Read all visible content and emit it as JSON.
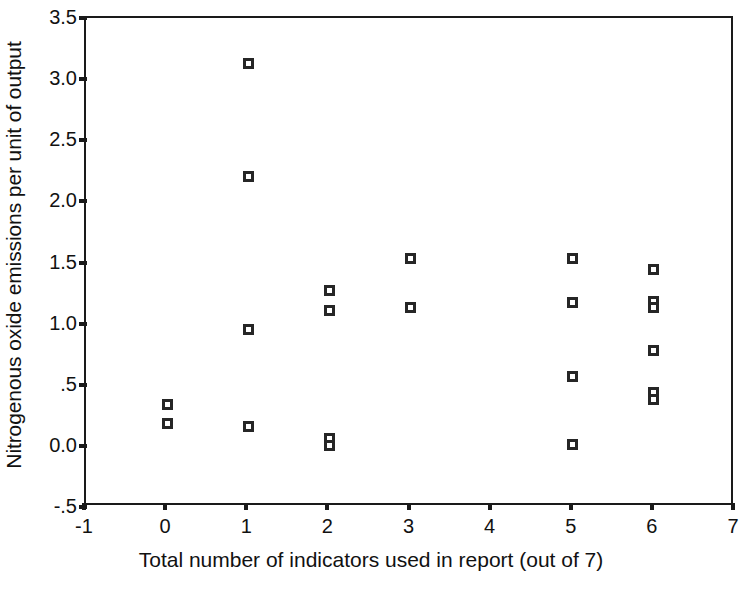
{
  "chart_data": {
    "type": "scatter",
    "title": "",
    "xlabel": "Total number of indicators used in report (out of 7)",
    "ylabel": "Nitrogenous oxide emissions per unit of output",
    "xlim": [
      -1,
      7
    ],
    "ylim": [
      -0.5,
      3.5
    ],
    "xticks": [
      -1,
      0,
      1,
      2,
      3,
      4,
      5,
      6,
      7
    ],
    "xtick_labels": [
      "-1",
      "0",
      "1",
      "2",
      "3",
      "4",
      "5",
      "6",
      "7"
    ],
    "yticks": [
      -0.5,
      0.0,
      0.5,
      1.0,
      1.5,
      2.0,
      2.5,
      3.0,
      3.5
    ],
    "ytick_labels": [
      "-.5",
      "0.0",
      ".5",
      "1.0",
      "1.5",
      "2.0",
      "2.5",
      "3.0",
      "3.5"
    ],
    "grid": false,
    "legend": false,
    "marker": "open-square",
    "marker_color": "#262626",
    "points": [
      {
        "x": 0,
        "y": 0.34
      },
      {
        "x": 0,
        "y": 0.18
      },
      {
        "x": 1,
        "y": 3.13
      },
      {
        "x": 1,
        "y": 2.2
      },
      {
        "x": 1,
        "y": 0.95
      },
      {
        "x": 1,
        "y": 0.16
      },
      {
        "x": 2,
        "y": 1.27
      },
      {
        "x": 2,
        "y": 1.11
      },
      {
        "x": 2,
        "y": 0.06
      },
      {
        "x": 2,
        "y": 0.0
      },
      {
        "x": 3,
        "y": 1.53
      },
      {
        "x": 3,
        "y": 1.13
      },
      {
        "x": 5,
        "y": 1.53
      },
      {
        "x": 5,
        "y": 1.17
      },
      {
        "x": 5,
        "y": 0.57
      },
      {
        "x": 5,
        "y": 0.01
      },
      {
        "x": 6,
        "y": 1.44
      },
      {
        "x": 6,
        "y": 1.18
      },
      {
        "x": 6,
        "y": 1.13
      },
      {
        "x": 6,
        "y": 0.78
      },
      {
        "x": 6,
        "y": 0.44
      },
      {
        "x": 6,
        "y": 0.38
      }
    ]
  }
}
